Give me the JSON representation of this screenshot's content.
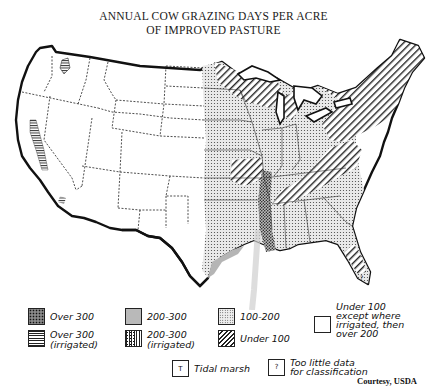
{
  "title": {
    "line1": "ANNUAL COW GRAZING DAYS PER ACRE",
    "line2": "OF IMPROVED PASTURE"
  },
  "map": {
    "region": "Conterminous United States",
    "theme": "Annual cow grazing days per acre of improved pasture",
    "zones": [
      {
        "area": "West (mountain & pacific states)",
        "category": "Under 100 except where irrigated, then over 200"
      },
      {
        "area": "Central Valley, California",
        "category": "Over 300 (irrigated)"
      },
      {
        "area": "Great Plains eastern edge / Corn Belt",
        "category": "100-200"
      },
      {
        "area": "Upper Midwest & Northeast",
        "category": "Under 100"
      },
      {
        "area": "Lower Mississippi valley",
        "category": "200-300"
      },
      {
        "area": "Southeast & Gulf Coast",
        "category": "100-200"
      },
      {
        "area": "Southern Florida",
        "category": "Too little data for classification"
      }
    ]
  },
  "legend": {
    "items": [
      {
        "key": "over300",
        "label": "Over 300",
        "icon": "cross-hatch-swatch"
      },
      {
        "key": "over300irr",
        "label": "Over 300\n(irrigated)",
        "icon": "horizontal-lines-swatch"
      },
      {
        "key": "200-300",
        "label": "200-300",
        "icon": "solid-gray-swatch"
      },
      {
        "key": "200-300irr",
        "label": "200-300\n(irrigated)",
        "icon": "vertical-lines-swatch"
      },
      {
        "key": "100-200",
        "label": "100-200",
        "icon": "dot-stipple-swatch"
      },
      {
        "key": "under100",
        "label": "Under 100",
        "icon": "diagonal-hatch-swatch"
      },
      {
        "key": "under100except",
        "label": "Under 100\nexcept where\nirrigated, then\nover 200",
        "icon": "blank-swatch"
      },
      {
        "key": "tidal",
        "symbol": "T",
        "label": "Tidal marsh",
        "icon": "tidal-marsh-box"
      },
      {
        "key": "nodata",
        "symbol": "?",
        "label": "Too little data\nfor classification",
        "icon": "question-box"
      }
    ]
  },
  "credit": "Courtesy, USDA",
  "colors": {
    "ink": "#111111",
    "gray_fill": "#b9b9b9",
    "stipple_bg": "#eeeeee",
    "background": "#ffffff"
  }
}
